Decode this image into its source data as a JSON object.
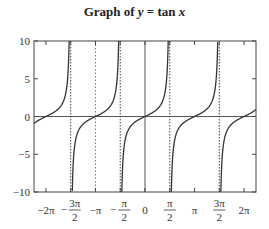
{
  "chart_data": {
    "type": "line",
    "title": "Graph of y = tan x",
    "title_parts": {
      "prefix": "Graph of ",
      "var": "y",
      "eq": " = tan ",
      "arg": "x"
    },
    "function": "tan(x)",
    "xlabel": "",
    "ylabel": "",
    "xlim": [
      -7.04,
      7.04
    ],
    "ylim": [
      -10,
      10
    ],
    "grid": false,
    "legend": null,
    "y_ticks": [
      {
        "value": 10,
        "label": "10"
      },
      {
        "value": 5,
        "label": "5"
      },
      {
        "value": 0,
        "label": "0"
      },
      {
        "value": -5,
        "label": "−5"
      },
      {
        "value": -10,
        "label": "−10"
      }
    ],
    "x_ticks": [
      {
        "value": -6.2832,
        "label": "−2π",
        "num": "",
        "den": ""
      },
      {
        "value": -4.7124,
        "label": "−3π/2",
        "sign": "−",
        "num": "3π",
        "den": "2"
      },
      {
        "value": -3.1416,
        "label": "−π",
        "num": "",
        "den": ""
      },
      {
        "value": -1.5708,
        "label": "−π/2",
        "sign": "−",
        "num": "π",
        "den": "2"
      },
      {
        "value": 0,
        "label": "0",
        "num": "",
        "den": ""
      },
      {
        "value": 1.5708,
        "label": "π/2",
        "sign": "",
        "num": "π",
        "den": "2"
      },
      {
        "value": 3.1416,
        "label": "π",
        "num": "",
        "den": ""
      },
      {
        "value": 4.7124,
        "label": "3π/2",
        "sign": "",
        "num": "3π",
        "den": "2"
      },
      {
        "value": 6.2832,
        "label": "2π",
        "num": "",
        "den": ""
      }
    ],
    "asymptotes": [
      -4.7124,
      -1.5708,
      1.5708,
      4.7124
    ],
    "extra_dotted_lines": [
      -3.1416
    ],
    "reference_lines": {
      "horizontal_y": 0,
      "vertical_x": 0
    },
    "series": [
      {
        "name": "tan x",
        "color": "#333333",
        "sample_points": [
          {
            "x": -7.04,
            "y": -0.95
          },
          {
            "x": -6.2832,
            "y": 0
          },
          {
            "x": -5.0,
            "y": 3.38
          },
          {
            "x": -4.812,
            "y": 10
          },
          {
            "x": -4.612,
            "y": -10
          },
          {
            "x": -3.1416,
            "y": 0
          },
          {
            "x": -1.671,
            "y": 10
          },
          {
            "x": -1.471,
            "y": -10
          },
          {
            "x": 0,
            "y": 0
          },
          {
            "x": 1.471,
            "y": 10
          },
          {
            "x": 1.671,
            "y": -10
          },
          {
            "x": 3.1416,
            "y": 0
          },
          {
            "x": 4.612,
            "y": 10
          },
          {
            "x": 4.812,
            "y": -10
          },
          {
            "x": 6.2832,
            "y": 0
          },
          {
            "x": 7.04,
            "y": 0.95
          }
        ]
      }
    ]
  }
}
